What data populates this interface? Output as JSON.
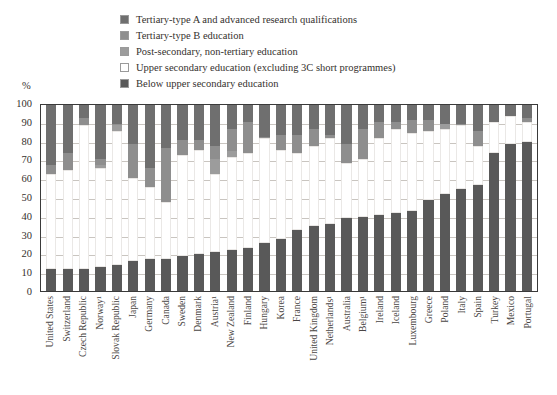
{
  "axis": {
    "unit_label": "%",
    "yticks": [
      "100",
      "90",
      "80",
      "70",
      "60",
      "50",
      "40",
      "30",
      "20",
      "10",
      "0"
    ]
  },
  "legend": {
    "position": "top",
    "items": [
      {
        "label": "Tertiary-type A and advanced research qualifications",
        "color": "#6f6f6f",
        "key": "tertiary_a"
      },
      {
        "label": "Tertiary-type B education",
        "color": "#8e8e8e",
        "key": "tertiary_b"
      },
      {
        "label": "Post-secondary, non-tertiary education",
        "color": "#9c9c9c",
        "key": "post_secondary"
      },
      {
        "label": "Upper secondary education (excluding 3C short programmes)",
        "color": "#ffffff",
        "key": "upper_secondary"
      },
      {
        "label": "Below upper secondary education",
        "color": "#595959",
        "key": "below_upper_secondary"
      }
    ]
  },
  "chart_data": {
    "type": "bar",
    "subtype": "stacked-column",
    "title": "",
    "xlabel": "",
    "ylabel": "%",
    "ylim": [
      0,
      100
    ],
    "ytick_step": 10,
    "grid": true,
    "stack_order_bottom_to_top": [
      "below_upper_secondary",
      "upper_secondary",
      "post_secondary",
      "tertiary_b",
      "tertiary_a"
    ],
    "categories": [
      "United States",
      "Switzerland",
      "Czech Republic",
      "Norway¹",
      "Slovak Republic",
      "Japan",
      "Germany",
      "Canada",
      "Sweden",
      "Denmark",
      "Austria¹",
      "New Zealand",
      "Finland",
      "Hungary",
      "Korea",
      "France",
      "United Kingdom",
      "Netherlands¹",
      "Australia",
      "Belgium¹",
      "Ireland",
      "Iceland",
      "Luxembourg",
      "Greece",
      "Poland",
      "Italy",
      "Spain",
      "Turkey",
      "Mexico",
      "Portugal"
    ],
    "series": [
      {
        "name": "Below upper secondary education",
        "key": "below_upper_secondary",
        "color": "#595959",
        "values": [
          12,
          12,
          12,
          13,
          14,
          16,
          17,
          17,
          19,
          20,
          21,
          22,
          23,
          26,
          28,
          33,
          35,
          36,
          39,
          40,
          41,
          42,
          43,
          49,
          52,
          55,
          57,
          74,
          79,
          80
        ]
      },
      {
        "name": "Upper secondary education (excluding 3C short programmes)",
        "key": "upper_secondary",
        "color": "#ffffff",
        "values": [
          51,
          53,
          77,
          53,
          72,
          45,
          39,
          31,
          54,
          56,
          42,
          50,
          51,
          56,
          48,
          41,
          43,
          46,
          30,
          31,
          41,
          45,
          42,
          37,
          35,
          34,
          21,
          17,
          15,
          11
        ]
      },
      {
        "name": "Post-secondary, non-tertiary education",
        "key": "post_secondary",
        "color": "#9c9c9c",
        "values": [
          0,
          0,
          0,
          2,
          3,
          0,
          0,
          0,
          0,
          0,
          8,
          3,
          0,
          0,
          0,
          0,
          0,
          0,
          0,
          0,
          0,
          0,
          0,
          0,
          3,
          0,
          0,
          0,
          0,
          0
        ]
      },
      {
        "name": "Tertiary-type B education",
        "key": "tertiary_b",
        "color": "#8e8e8e",
        "values": [
          5,
          9,
          4,
          3,
          1,
          18,
          10,
          29,
          8,
          5,
          7,
          12,
          17,
          1,
          8,
          10,
          9,
          2,
          10,
          16,
          9,
          4,
          7,
          6,
          0,
          1,
          8,
          0,
          0,
          2
        ]
      },
      {
        "name": "Tertiary-type A and advanced research qualifications",
        "key": "tertiary_a",
        "color": "#6f6f6f",
        "values": [
          32,
          26,
          7,
          29,
          10,
          21,
          34,
          23,
          19,
          19,
          22,
          13,
          9,
          17,
          16,
          16,
          13,
          16,
          21,
          13,
          9,
          9,
          8,
          8,
          10,
          10,
          14,
          9,
          6,
          7
        ]
      }
    ]
  }
}
